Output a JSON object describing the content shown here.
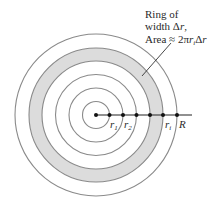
{
  "diagram": {
    "center": {
      "x": 96,
      "y": 115
    },
    "circle_radii": [
      13.5,
      27,
      40.5,
      54,
      67,
      81
    ],
    "shaded_ring": {
      "inner_radius": 54,
      "outer_radius": 67,
      "fill": "#dcdcdc"
    },
    "stroke_color": "#8a8a8a",
    "axis_color": "#222222",
    "dot_x": [
      96,
      109,
      122,
      136,
      149,
      163,
      177
    ],
    "annotation": {
      "line1": "Ring of",
      "line2_prefix": "width ",
      "line2_delta": "Δ",
      "line2_var": "r",
      "line2_suffix": ",",
      "line3_prefix": "Area ≈ 2π",
      "line3_var": "r",
      "line3_sub": "i",
      "line3_delta": "Δ",
      "line3_var2": "r"
    },
    "labels": {
      "r1_main": "r",
      "r1_sub": "1",
      "r2_main": "r",
      "r2_sub": "2",
      "ri_main": "r",
      "ri_sub": "i",
      "R": "R"
    }
  }
}
